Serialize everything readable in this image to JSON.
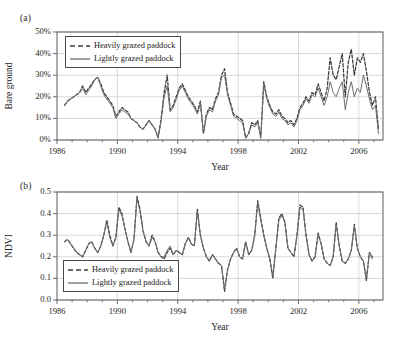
{
  "figure": {
    "panels": [
      {
        "tag": "(a)",
        "ylabel": "Bare ground",
        "xlabel": "Year",
        "legend": [
          {
            "label": "Heavily grazed paddock",
            "style": "dashed"
          },
          {
            "label": "Lightly grazed paddock",
            "style": "solid"
          }
        ],
        "yticks": [
          "0%",
          "10%",
          "20%",
          "30%",
          "40%",
          "50%"
        ],
        "xticks": [
          "1986",
          "1990",
          "1994",
          "1998",
          "2002",
          "2006"
        ]
      },
      {
        "tag": "(b)",
        "ylabel": "NDVI",
        "xlabel": "Year",
        "legend": [
          {
            "label": "Heavily grazed paddock",
            "style": "dashed"
          },
          {
            "label": "Lightly grazed paddock",
            "style": "solid"
          }
        ],
        "yticks": [
          "0.0",
          "0.1",
          "0.2",
          "0.3",
          "0.4",
          "0.5"
        ],
        "xticks": [
          "1986",
          "1990",
          "1994",
          "1998",
          "2002",
          "2006"
        ]
      }
    ]
  },
  "colors": {
    "heavy_line": "#3a3a3a",
    "light_line": "#6e6e6e",
    "grid": "#c8c8c8",
    "frame": "#5a5a5a",
    "text": "#1e1e1e",
    "background": "#ffffff"
  },
  "chart_data": [
    {
      "type": "line",
      "title": "(a) Bare ground",
      "xlabel": "Year",
      "ylabel": "Bare ground",
      "xlim": [
        1986.0,
        2007.6
      ],
      "ylim": [
        0,
        50
      ],
      "yunit": "%",
      "grid": true,
      "legend_position": "top-left",
      "xticks": [
        1986,
        1990,
        1994,
        1998,
        2002,
        2006
      ],
      "yticks": [
        0,
        10,
        20,
        30,
        40,
        50
      ],
      "series": [
        {
          "name": "Heavily grazed paddock",
          "style": "dashed",
          "x": [
            1986.5,
            1986.7,
            1986.9,
            1987.1,
            1987.3,
            1987.5,
            1987.7,
            1987.9,
            1988.1,
            1988.3,
            1988.5,
            1988.7,
            1988.9,
            1989.1,
            1989.3,
            1989.5,
            1989.7,
            1989.9,
            1990.1,
            1990.3,
            1990.5,
            1990.7,
            1990.9,
            1991.1,
            1991.3,
            1991.5,
            1991.7,
            1991.9,
            1992.1,
            1992.3,
            1992.5,
            1992.7,
            1992.9,
            1993.1,
            1993.3,
            1993.5,
            1993.7,
            1993.9,
            1994.1,
            1994.3,
            1994.5,
            1994.7,
            1994.9,
            1995.1,
            1995.3,
            1995.5,
            1995.7,
            1995.9,
            1996.1,
            1996.3,
            1996.5,
            1996.7,
            1996.9,
            1997.1,
            1997.3,
            1997.5,
            1997.7,
            1997.9,
            1998.1,
            1998.3,
            1998.5,
            1998.7,
            1998.9,
            1999.1,
            1999.3,
            1999.5,
            1999.7,
            1999.9,
            2000.1,
            2000.3,
            2000.5,
            2000.7,
            2000.9,
            2001.1,
            2001.3,
            2001.5,
            2001.7,
            2001.9,
            2002.1,
            2002.3,
            2002.5,
            2002.7,
            2002.9,
            2003.1,
            2003.3,
            2003.5,
            2003.7,
            2003.9,
            2004.1,
            2004.3,
            2004.5,
            2004.7,
            2004.9,
            2005.1,
            2005.3,
            2005.5,
            2005.7,
            2005.9,
            2006.1,
            2006.3,
            2006.5,
            2006.7,
            2006.9,
            2007.1,
            2007.3
          ],
          "y": [
            16,
            18,
            19,
            20,
            21,
            22,
            25,
            22,
            24,
            26,
            28,
            29,
            26,
            22,
            20,
            18,
            16,
            11,
            13,
            15,
            14,
            13,
            10,
            9,
            8,
            6,
            5,
            7,
            9,
            7,
            5,
            1,
            10,
            22,
            30,
            14,
            16,
            20,
            24,
            26,
            23,
            20,
            18,
            16,
            13,
            18,
            3,
            12,
            15,
            14,
            19,
            22,
            30,
            33,
            22,
            17,
            12,
            11,
            10,
            9,
            1,
            3,
            8,
            7,
            9,
            1,
            27,
            20,
            16,
            13,
            12,
            14,
            11,
            10,
            8,
            9,
            7,
            10,
            15,
            17,
            20,
            18,
            22,
            21,
            26,
            22,
            18,
            24,
            38,
            30,
            28,
            34,
            40,
            20,
            36,
            42,
            30,
            38,
            36,
            40,
            32,
            22,
            16,
            20,
            5
          ],
          "gaps": [
            [
              1999.5,
              1999.7
            ]
          ]
        },
        {
          "name": "Lightly grazed paddock",
          "style": "solid",
          "x": [
            1986.5,
            1986.7,
            1986.9,
            1987.1,
            1987.3,
            1987.5,
            1987.7,
            1987.9,
            1988.1,
            1988.3,
            1988.5,
            1988.7,
            1988.9,
            1989.1,
            1989.3,
            1989.5,
            1989.7,
            1989.9,
            1990.1,
            1990.3,
            1990.5,
            1990.7,
            1990.9,
            1991.1,
            1991.3,
            1991.5,
            1991.7,
            1991.9,
            1992.1,
            1992.3,
            1992.5,
            1992.7,
            1992.9,
            1993.1,
            1993.3,
            1993.5,
            1993.7,
            1993.9,
            1994.1,
            1994.3,
            1994.5,
            1994.7,
            1994.9,
            1995.1,
            1995.3,
            1995.5,
            1995.7,
            1995.9,
            1996.1,
            1996.3,
            1996.5,
            1996.7,
            1996.9,
            1997.1,
            1997.3,
            1997.5,
            1997.7,
            1997.9,
            1998.1,
            1998.3,
            1998.5,
            1998.7,
            1998.9,
            1999.1,
            1999.3,
            1999.5,
            1999.7,
            1999.9,
            2000.1,
            2000.3,
            2000.5,
            2000.7,
            2000.9,
            2001.1,
            2001.3,
            2001.5,
            2001.7,
            2001.9,
            2002.1,
            2002.3,
            2002.5,
            2002.7,
            2002.9,
            2003.1,
            2003.3,
            2003.5,
            2003.7,
            2003.9,
            2004.1,
            2004.3,
            2004.5,
            2004.7,
            2004.9,
            2005.1,
            2005.3,
            2005.5,
            2005.7,
            2005.9,
            2006.1,
            2006.3,
            2006.5,
            2006.7,
            2006.9,
            2007.1,
            2007.3
          ],
          "y": [
            16,
            18,
            19,
            20,
            21,
            22,
            24,
            21,
            23,
            25,
            28,
            29,
            25,
            21,
            19,
            17,
            15,
            10,
            12,
            14,
            13,
            12,
            10,
            9,
            8,
            6,
            5,
            7,
            9,
            7,
            5,
            1,
            9,
            20,
            25,
            13,
            15,
            19,
            23,
            25,
            22,
            19,
            17,
            15,
            12,
            17,
            3,
            11,
            14,
            13,
            18,
            21,
            29,
            30,
            21,
            16,
            11,
            10,
            9,
            8,
            1,
            3,
            7,
            6,
            8,
            1,
            26,
            19,
            15,
            12,
            11,
            13,
            10,
            9,
            7,
            8,
            6,
            9,
            14,
            16,
            19,
            17,
            21,
            20,
            24,
            20,
            16,
            20,
            27,
            22,
            20,
            24,
            27,
            14,
            22,
            27,
            20,
            24,
            22,
            30,
            25,
            19,
            14,
            16,
            3
          ],
          "gaps": [
            [
              1999.5,
              1999.7
            ]
          ]
        }
      ]
    },
    {
      "type": "line",
      "title": "(b) NDVI",
      "xlabel": "Year",
      "ylabel": "NDVI",
      "xlim": [
        1986.0,
        2007.6
      ],
      "ylim": [
        0.0,
        0.5
      ],
      "grid": true,
      "legend_position": "bottom-left",
      "xticks": [
        1986,
        1990,
        1994,
        1998,
        2002,
        2006
      ],
      "yticks": [
        0.0,
        0.1,
        0.2,
        0.3,
        0.4,
        0.5
      ],
      "series": [
        {
          "name": "Heavily grazed paddock",
          "style": "dashed",
          "x": [
            1986.5,
            1986.7,
            1986.9,
            1987.1,
            1987.3,
            1987.5,
            1987.7,
            1987.9,
            1988.1,
            1988.3,
            1988.5,
            1988.7,
            1988.9,
            1989.1,
            1989.3,
            1989.5,
            1989.7,
            1989.9,
            1990.1,
            1990.3,
            1990.5,
            1990.7,
            1990.9,
            1991.1,
            1991.3,
            1991.5,
            1991.7,
            1991.9,
            1992.1,
            1992.3,
            1992.5,
            1992.7,
            1992.9,
            1993.1,
            1993.3,
            1993.5,
            1993.7,
            1993.9,
            1994.1,
            1994.3,
            1994.5,
            1994.7,
            1994.9,
            1995.1,
            1995.3,
            1995.5,
            1995.7,
            1995.9,
            1996.1,
            1996.3,
            1996.5,
            1996.7,
            1996.9,
            1997.1,
            1997.3,
            1997.5,
            1997.7,
            1997.9,
            1998.1,
            1998.3,
            1998.5,
            1998.7,
            1998.9,
            1999.1,
            1999.3,
            1999.5,
            1999.7,
            1999.9,
            2000.1,
            2000.3,
            2000.5,
            2000.7,
            2000.9,
            2001.1,
            2001.3,
            2001.5,
            2001.7,
            2001.9,
            2002.1,
            2002.3,
            2002.5,
            2002.7,
            2002.9,
            2003.1,
            2003.3,
            2003.5,
            2003.7,
            2003.9,
            2004.1,
            2004.3,
            2004.5,
            2004.7,
            2004.9,
            2005.1,
            2005.3,
            2005.5,
            2005.7,
            2005.9,
            2006.1,
            2006.3,
            2006.5,
            2006.7,
            2006.9,
            2007.1,
            2007.3
          ],
          "y": [
            0.27,
            0.28,
            0.26,
            0.24,
            0.22,
            0.21,
            0.2,
            0.23,
            0.26,
            0.27,
            0.24,
            0.22,
            0.25,
            0.3,
            0.37,
            0.3,
            0.25,
            0.29,
            0.43,
            0.4,
            0.33,
            0.27,
            0.22,
            0.28,
            0.48,
            0.42,
            0.32,
            0.27,
            0.25,
            0.3,
            0.27,
            0.22,
            0.2,
            0.19,
            0.22,
            0.24,
            0.21,
            0.23,
            0.22,
            0.21,
            0.26,
            0.29,
            0.26,
            0.25,
            0.42,
            0.3,
            0.24,
            0.2,
            0.18,
            0.21,
            0.19,
            0.17,
            0.16,
            0.04,
            0.14,
            0.19,
            0.22,
            0.24,
            0.2,
            0.19,
            0.27,
            0.21,
            0.23,
            0.3,
            0.46,
            0.38,
            0.3,
            0.24,
            0.19,
            0.1,
            0.24,
            0.38,
            0.4,
            0.36,
            0.24,
            0.22,
            0.2,
            0.3,
            0.44,
            0.43,
            0.3,
            0.21,
            0.18,
            0.2,
            0.31,
            0.26,
            0.19,
            0.17,
            0.16,
            0.2,
            0.36,
            0.25,
            0.18,
            0.17,
            0.19,
            0.23,
            0.35,
            0.24,
            0.2,
            0.18,
            0.09,
            0.22,
            0.2
          ],
          "gaps": []
        },
        {
          "name": "Lightly grazed paddock",
          "style": "solid",
          "x": [
            1986.5,
            1986.7,
            1986.9,
            1987.1,
            1987.3,
            1987.5,
            1987.7,
            1987.9,
            1988.1,
            1988.3,
            1988.5,
            1988.7,
            1988.9,
            1989.1,
            1989.3,
            1989.5,
            1989.7,
            1989.9,
            1990.1,
            1990.3,
            1990.5,
            1990.7,
            1990.9,
            1991.1,
            1991.3,
            1991.5,
            1991.7,
            1991.9,
            1992.1,
            1992.3,
            1992.5,
            1992.7,
            1992.9,
            1993.1,
            1993.3,
            1993.5,
            1993.7,
            1993.9,
            1994.1,
            1994.3,
            1994.5,
            1994.7,
            1994.9,
            1995.1,
            1995.3,
            1995.5,
            1995.7,
            1995.9,
            1996.1,
            1996.3,
            1996.5,
            1996.7,
            1996.9,
            1997.1,
            1997.3,
            1997.5,
            1997.7,
            1997.9,
            1998.1,
            1998.3,
            1998.5,
            1998.7,
            1998.9,
            1999.1,
            1999.3,
            1999.5,
            1999.7,
            1999.9,
            2000.1,
            2000.3,
            2000.5,
            2000.7,
            2000.9,
            2001.1,
            2001.3,
            2001.5,
            2001.7,
            2001.9,
            2002.1,
            2002.3,
            2002.5,
            2002.7,
            2002.9,
            2003.1,
            2003.3,
            2003.5,
            2003.7,
            2003.9,
            2004.1,
            2004.3,
            2004.5,
            2004.7,
            2004.9,
            2005.1,
            2005.3,
            2005.5,
            2005.7,
            2005.9,
            2006.1,
            2006.3,
            2006.5,
            2006.7,
            2006.9,
            2007.1,
            2007.3
          ],
          "y": [
            0.27,
            0.28,
            0.26,
            0.24,
            0.22,
            0.21,
            0.2,
            0.23,
            0.26,
            0.27,
            0.24,
            0.22,
            0.25,
            0.3,
            0.36,
            0.29,
            0.25,
            0.29,
            0.42,
            0.39,
            0.33,
            0.27,
            0.22,
            0.28,
            0.47,
            0.41,
            0.32,
            0.27,
            0.25,
            0.29,
            0.27,
            0.22,
            0.2,
            0.2,
            0.23,
            0.25,
            0.21,
            0.23,
            0.22,
            0.21,
            0.26,
            0.29,
            0.26,
            0.25,
            0.41,
            0.3,
            0.24,
            0.2,
            0.18,
            0.21,
            0.19,
            0.17,
            0.16,
            0.05,
            0.14,
            0.19,
            0.22,
            0.24,
            0.2,
            0.19,
            0.27,
            0.21,
            0.23,
            0.3,
            0.45,
            0.37,
            0.3,
            0.24,
            0.19,
            0.11,
            0.24,
            0.37,
            0.39,
            0.36,
            0.24,
            0.22,
            0.2,
            0.3,
            0.43,
            0.42,
            0.3,
            0.21,
            0.18,
            0.2,
            0.3,
            0.26,
            0.19,
            0.17,
            0.16,
            0.2,
            0.35,
            0.25,
            0.18,
            0.17,
            0.19,
            0.23,
            0.34,
            0.24,
            0.2,
            0.18,
            0.1,
            0.22,
            0.19
          ],
          "gaps": []
        }
      ]
    }
  ]
}
